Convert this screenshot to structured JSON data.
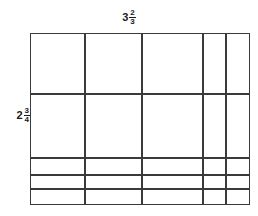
{
  "diagram": {
    "kind": "area-model-grid",
    "background_color": "#ffffff",
    "line_color": "#3a3a3a",
    "line_width": 1.4
  },
  "labels": {
    "top": {
      "name": "width-label",
      "whole": "3",
      "numerator": "2",
      "denominator": "3",
      "text": "3 2/3"
    },
    "left": {
      "name": "height-label",
      "whole": "2",
      "numerator": "3",
      "denominator": "4",
      "text": "2 3/4"
    }
  },
  "grid": {
    "origin_x": 30,
    "origin_y": 33,
    "width": 220,
    "height": 172,
    "column_labels": [
      "1",
      "1",
      "1",
      "1/3",
      "1/3"
    ],
    "row_labels": [
      "1",
      "1",
      "1/4",
      "1/4",
      "1/4"
    ],
    "column_fractions": [
      1,
      1,
      1,
      0.3333,
      0.3333
    ],
    "row_fractions": [
      1,
      1,
      0.25,
      0.25,
      0.25
    ],
    "vertical_line_x": [
      0,
      55,
      112,
      173,
      196,
      220
    ],
    "horizontal_line_y": [
      0,
      61,
      125,
      142,
      156,
      172
    ]
  },
  "chart_data": {
    "type": "table",
    "xlabel": "3 2/3",
    "ylabel": "2 3/4",
    "categories": [
      "1",
      "1",
      "1",
      "1/3",
      "1/3"
    ],
    "values": [
      1,
      1,
      1,
      0.3333,
      0.3333
    ],
    "series": [
      {
        "name": "row 1",
        "values": [
          1,
          1,
          1,
          0.3333,
          0.3333
        ]
      },
      {
        "name": "row 1 (second)",
        "values": [
          1,
          1,
          1,
          0.3333,
          0.3333
        ]
      },
      {
        "name": "row 1/4 (a)",
        "values": [
          0.25,
          0.25,
          0.25,
          0.0833,
          0.0833
        ]
      },
      {
        "name": "row 1/4 (b)",
        "values": [
          0.25,
          0.25,
          0.25,
          0.0833,
          0.0833
        ]
      },
      {
        "name": "row 1/4 (c)",
        "values": [
          0.25,
          0.25,
          0.25,
          0.0833,
          0.0833
        ]
      }
    ],
    "grid": true,
    "legend": "none"
  }
}
